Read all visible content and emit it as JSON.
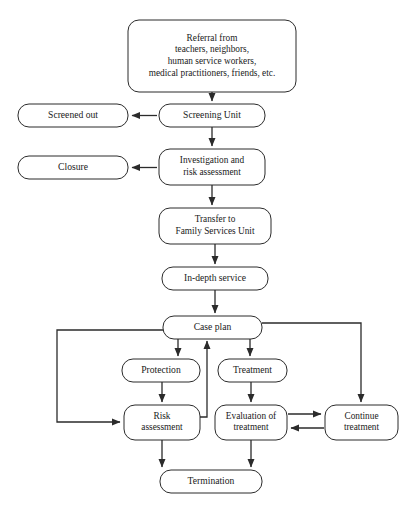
{
  "diagram": {
    "type": "flowchart",
    "orientation": "top-to-bottom",
    "colors": {
      "background": "#ffffff",
      "box_fill": "#ffffff",
      "box_stroke": "#2b2b2b",
      "edge_stroke": "#2b2b2b",
      "text": "#1a1a1a"
    },
    "nodes": [
      {
        "id": "referral",
        "name": "referral-node",
        "lines": [
          "Referral from",
          "teachers, neighbors,",
          "human service workers,",
          "medical practitioners, friends, etc."
        ],
        "x": 128,
        "y": 20,
        "w": 168,
        "h": 72
      },
      {
        "id": "screening-unit",
        "name": "screening-unit-node",
        "lines": [
          "Screening Unit"
        ],
        "x": 159,
        "y": 104,
        "w": 106,
        "h": 23
      },
      {
        "id": "screened-out",
        "name": "screened-out-node",
        "lines": [
          "Screened out"
        ],
        "x": 18,
        "y": 104,
        "w": 110,
        "h": 23
      },
      {
        "id": "investigation",
        "name": "investigation-node",
        "lines": [
          "Investigation and",
          "risk assessment"
        ],
        "x": 159,
        "y": 149,
        "w": 106,
        "h": 36
      },
      {
        "id": "closure",
        "name": "closure-node",
        "lines": [
          "Closure"
        ],
        "x": 18,
        "y": 156,
        "w": 110,
        "h": 23
      },
      {
        "id": "transfer",
        "name": "transfer-node",
        "lines": [
          "Transfer to",
          "Family Services Unit"
        ],
        "x": 159,
        "y": 208,
        "w": 112,
        "h": 36
      },
      {
        "id": "in-depth-service",
        "name": "in-depth-service-node",
        "lines": [
          "In-depth service"
        ],
        "x": 162,
        "y": 267,
        "w": 106,
        "h": 23
      },
      {
        "id": "case-plan",
        "name": "case-plan-node",
        "lines": [
          "Case plan"
        ],
        "x": 163,
        "y": 316,
        "w": 99,
        "h": 23
      },
      {
        "id": "protection",
        "name": "protection-node",
        "lines": [
          "Protection"
        ],
        "x": 122,
        "y": 359,
        "w": 78,
        "h": 23
      },
      {
        "id": "treatment",
        "name": "treatment-node",
        "lines": [
          "Treatment"
        ],
        "x": 218,
        "y": 359,
        "w": 69,
        "h": 23
      },
      {
        "id": "risk-assessment",
        "name": "risk-assessment-node",
        "lines": [
          "Risk",
          "assessment"
        ],
        "x": 124,
        "y": 405,
        "w": 76,
        "h": 35
      },
      {
        "id": "evaluation",
        "name": "evaluation-node",
        "lines": [
          "Evaluation of",
          "treatment"
        ],
        "x": 215,
        "y": 405,
        "w": 72,
        "h": 35
      },
      {
        "id": "continue-treatment",
        "name": "continue-treatment-node",
        "lines": [
          "Continue",
          "treatment"
        ],
        "x": 325,
        "y": 405,
        "w": 73,
        "h": 35
      },
      {
        "id": "termination",
        "name": "termination-node",
        "lines": [
          "Termination"
        ],
        "x": 160,
        "y": 470,
        "w": 102,
        "h": 23
      }
    ],
    "edges": [
      {
        "id": "e1",
        "name": "edge-referral-to-screening",
        "from": "referral",
        "to": "screening-unit",
        "path": "M 212 92 L 212 101",
        "arrow": "end"
      },
      {
        "id": "e2",
        "name": "edge-screening-to-screened-out",
        "from": "screening-unit",
        "to": "screened-out",
        "path": "M 157 115.5 L 132 115.5",
        "arrow": "end"
      },
      {
        "id": "e3",
        "name": "edge-screening-to-investigation",
        "from": "screening-unit",
        "to": "investigation",
        "path": "M 212 127 L 212 146",
        "arrow": "end"
      },
      {
        "id": "e4",
        "name": "edge-investigation-to-closure",
        "from": "investigation",
        "to": "closure",
        "path": "M 157 167.5 L 132 167.5",
        "arrow": "end"
      },
      {
        "id": "e5",
        "name": "edge-investigation-to-transfer",
        "from": "investigation",
        "to": "transfer",
        "path": "M 212 185 L 212 205",
        "arrow": "end"
      },
      {
        "id": "e6",
        "name": "edge-transfer-to-in-depth",
        "from": "transfer",
        "to": "in-depth-service",
        "path": "M 215 244 L 215 264",
        "arrow": "end"
      },
      {
        "id": "e7",
        "name": "edge-in-depth-to-case-plan",
        "from": "in-depth-service",
        "to": "case-plan",
        "path": "M 215 290 L 215 313",
        "arrow": "end"
      },
      {
        "id": "e8",
        "name": "edge-case-plan-to-protection",
        "from": "case-plan",
        "to": "protection",
        "path": "M 178 339 L 178 356",
        "arrow": "end"
      },
      {
        "id": "e9",
        "name": "edge-case-plan-to-treatment",
        "from": "case-plan",
        "to": "treatment",
        "path": "M 250 339 L 250 356",
        "arrow": "end"
      },
      {
        "id": "e10",
        "name": "edge-protection-to-risk-assessment",
        "from": "protection",
        "to": "risk-assessment",
        "path": "M 162 382 L 162 402",
        "arrow": "end"
      },
      {
        "id": "e11",
        "name": "edge-treatment-to-evaluation",
        "from": "treatment",
        "to": "evaluation",
        "path": "M 251 382 L 251 402",
        "arrow": "end"
      },
      {
        "id": "e12",
        "name": "edge-case-plan-left-loop-to-risk",
        "from": "case-plan",
        "to": "risk-assessment",
        "path": "M 163 330 L 57 330 L 57 422 L 120 422",
        "arrow": "end"
      },
      {
        "id": "e13",
        "name": "edge-risk-assessment-to-case-plan",
        "from": "risk-assessment",
        "to": "case-plan",
        "path": "M 200 417 L 207 417 L 207 341",
        "arrow": "end"
      },
      {
        "id": "e14",
        "name": "edge-case-plan-right-loop-to-continue",
        "from": "case-plan",
        "to": "continue-treatment",
        "path": "M 262 323 L 361 323 L 361 402",
        "arrow": "end"
      },
      {
        "id": "e15",
        "name": "edge-evaluation-to-continue",
        "from": "evaluation",
        "to": "continue-treatment",
        "path": "M 288 414 L 321 414",
        "arrow": "end"
      },
      {
        "id": "e16",
        "name": "edge-continue-to-evaluation",
        "from": "continue-treatment",
        "to": "evaluation",
        "path": "M 324 428 L 291 428",
        "arrow": "end"
      },
      {
        "id": "e17",
        "name": "edge-risk-assessment-to-termination",
        "from": "risk-assessment",
        "to": "termination",
        "path": "M 162 440 L 162 467",
        "arrow": "end"
      },
      {
        "id": "e18",
        "name": "edge-evaluation-to-termination",
        "from": "evaluation",
        "to": "termination",
        "path": "M 251 440 L 251 467",
        "arrow": "end"
      }
    ]
  }
}
